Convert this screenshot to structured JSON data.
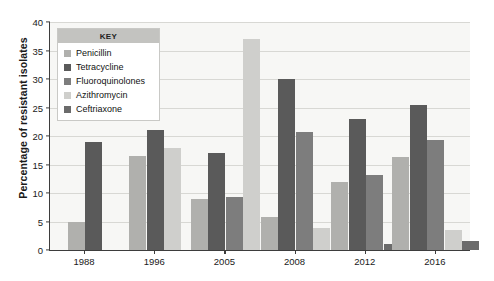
{
  "chart_data": {
    "type": "bar",
    "title": "",
    "xlabel": "",
    "ylabel": "Percentage of resistant isolates",
    "ylim": [
      0,
      40
    ],
    "yticks": [
      0,
      5,
      10,
      15,
      20,
      25,
      30,
      35,
      40
    ],
    "grid": true,
    "legend_position": "upper-left-inside",
    "legend_title": "KEY",
    "categories": [
      "1988",
      "1996",
      "2005",
      "2008",
      "2012",
      "2016"
    ],
    "series": [
      {
        "name": "Penicillin",
        "color": "#b0b0ad",
        "values": [
          5.0,
          16.5,
          9.0,
          5.8,
          12.0,
          16.3
        ]
      },
      {
        "name": "Tetracycline",
        "color": "#5a5a5a",
        "values": [
          19.0,
          21.0,
          17.0,
          30.0,
          23.0,
          25.5
        ]
      },
      {
        "name": "Fluoroquinolones",
        "color": "#7d7d7d",
        "values": [
          null,
          null,
          9.3,
          20.7,
          13.2,
          19.3
        ]
      },
      {
        "name": "Azithromycin",
        "color": "#cfcfcc",
        "values": [
          null,
          17.9,
          37.0,
          3.8,
          null,
          3.5
        ]
      },
      {
        "name": "Ceftriaxone",
        "color": "#6b6b6b",
        "values": [
          null,
          null,
          null,
          null,
          1.0,
          1.5
        ]
      }
    ]
  },
  "axis": {
    "y_tick_labels": [
      "0",
      "5",
      "10",
      "15",
      "20",
      "25",
      "30",
      "35",
      "40"
    ],
    "y_title": "Percentage of resistant isolates",
    "x_tick_labels": [
      "1988",
      "1996",
      "2005",
      "2008",
      "2012",
      "2016"
    ]
  },
  "legend": {
    "title": "KEY",
    "items": [
      {
        "label": "Penicillin",
        "color": "#b0b0ad"
      },
      {
        "label": "Tetracycline",
        "color": "#5a5a5a"
      },
      {
        "label": "Fluoroquinolones",
        "color": "#7d7d7d"
      },
      {
        "label": "Azithromycin",
        "color": "#cfcfcc"
      },
      {
        "label": "Ceftriaxone",
        "color": "#6b6b6b"
      }
    ]
  },
  "style": {
    "plot_background": "#f7f7f5",
    "grid_color": "#d8d8d4",
    "axis_color": "#3d3d3d",
    "page_background": "#ffffff"
  }
}
